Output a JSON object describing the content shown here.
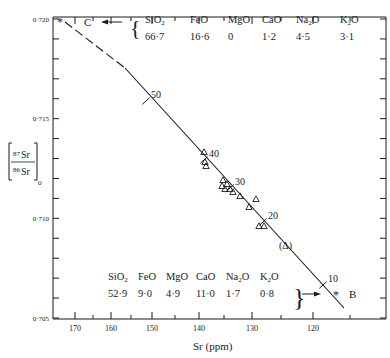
{
  "chart_data": {
    "type": "scatter",
    "title": "",
    "xlabel": "Sr (ppm)",
    "ylabel": "[87Sr/86Sr]0",
    "ylabel_parts": {
      "num_sup": "87",
      "num": "Sr",
      "den_sup": "86",
      "den": "Sr",
      "sub": "0"
    },
    "xlim": [
      175,
      110
    ],
    "ylim": [
      0.705,
      0.72
    ],
    "x_ticks": [
      {
        "value": 170,
        "label": "170",
        "px": 75
      },
      {
        "value": 165,
        "label": "",
        "px": 93
      },
      {
        "value": 160,
        "label": "160",
        "px": 111
      },
      {
        "value": 155,
        "label": "",
        "px": 131
      },
      {
        "value": 150,
        "label": "150",
        "px": 152
      },
      {
        "value": 145,
        "label": "",
        "px": 175
      },
      {
        "value": 140,
        "label": "140",
        "px": 199
      },
      {
        "value": 135,
        "label": "",
        "px": 224
      },
      {
        "value": 130,
        "label": "130",
        "px": 252
      },
      {
        "value": 125,
        "label": "",
        "px": 281
      },
      {
        "value": 120,
        "label": "120",
        "px": 313
      },
      {
        "value": 115,
        "label": "",
        "px": 350
      }
    ],
    "y_ticks": [
      {
        "value": 0.72,
        "label": "0·720"
      },
      {
        "value": 0.719,
        "label": ""
      },
      {
        "value": 0.718,
        "label": ""
      },
      {
        "value": 0.717,
        "label": ""
      },
      {
        "value": 0.716,
        "label": ""
      },
      {
        "value": 0.715,
        "label": "0·715"
      },
      {
        "value": 0.714,
        "label": ""
      },
      {
        "value": 0.713,
        "label": ""
      },
      {
        "value": 0.712,
        "label": ""
      },
      {
        "value": 0.711,
        "label": ""
      },
      {
        "value": 0.71,
        "label": "0·710"
      },
      {
        "value": 0.709,
        "label": ""
      },
      {
        "value": 0.708,
        "label": ""
      },
      {
        "value": 0.707,
        "label": ""
      },
      {
        "value": 0.706,
        "label": ""
      },
      {
        "value": 0.705,
        "label": "0·705"
      }
    ],
    "grid": false,
    "mixing_line": {
      "description": "Mixing line between end-members C and B; dashed toward C",
      "dashed_segment_px": [
        [
          65,
          22
        ],
        [
          125,
          68
        ]
      ],
      "solid_segment_px": [
        [
          125,
          68
        ],
        [
          344,
          308
        ]
      ],
      "percent_marks": [
        {
          "label": "50",
          "px": [
            146,
            101
          ]
        },
        {
          "label": "40",
          "px": [
            204,
            160
          ]
        },
        {
          "label": "30",
          "px": [
            230,
            188
          ]
        },
        {
          "label": "20",
          "px": [
            263,
            222
          ]
        },
        {
          "label": "10",
          "px": [
            323,
            285
          ]
        }
      ]
    },
    "series": [
      {
        "name": "samples",
        "marker": "triangle",
        "points_px": [
          [
            204,
            152
          ],
          [
            205,
            162
          ],
          [
            206,
            166
          ],
          [
            223,
            180
          ],
          [
            222,
            186
          ],
          [
            227,
            184
          ],
          [
            225,
            189
          ],
          [
            230,
            189
          ],
          [
            233,
            192
          ],
          [
            240,
            196
          ],
          [
            256,
            199
          ],
          [
            249,
            207
          ],
          [
            259,
            226
          ],
          [
            264,
            226
          ]
        ],
        "approx_values": [
          {
            "sr": 139.5,
            "ratio": 0.7137
          },
          {
            "sr": 139.3,
            "ratio": 0.7132
          },
          {
            "sr": 139.2,
            "ratio": 0.713
          },
          {
            "sr": 135.2,
            "ratio": 0.7123
          },
          {
            "sr": 135.4,
            "ratio": 0.712
          },
          {
            "sr": 134.4,
            "ratio": 0.7121
          },
          {
            "sr": 134.8,
            "ratio": 0.7119
          },
          {
            "sr": 133.8,
            "ratio": 0.7119
          },
          {
            "sr": 133.2,
            "ratio": 0.7117
          },
          {
            "sr": 131.9,
            "ratio": 0.7115
          },
          {
            "sr": 129.3,
            "ratio": 0.7114
          },
          {
            "sr": 130.4,
            "ratio": 0.711
          },
          {
            "sr": 128.8,
            "ratio": 0.7101
          },
          {
            "sr": 127.9,
            "ratio": 0.7101
          }
        ]
      }
    ],
    "annotations": [
      {
        "text": "(Δ)",
        "px": [
          287,
          245
        ]
      },
      {
        "text": "*",
        "label": "C",
        "note": "end-member C at Sr≈170, ratio 0.720, arrow pointing left"
      },
      {
        "text": "*",
        "label": "B",
        "note": "end-member B at Sr≈117, ratio≈0.7068, arrow pointing right"
      }
    ],
    "endmember_C": {
      "label": "C",
      "oxides": [
        "SiO2",
        "FeO",
        "MgO",
        "CaO",
        "Na2O",
        "K2O"
      ],
      "values": [
        "66·7",
        "16·6",
        "0",
        "1·2",
        "4·5",
        "3·1"
      ]
    },
    "endmember_B": {
      "label": "B",
      "oxides": [
        "SiO2",
        "FeO",
        "MgO",
        "CaO",
        "Na2O",
        "K2O"
      ],
      "values": [
        "52·9",
        "9·0",
        "4·9",
        "11·0",
        "1·7",
        "0·8"
      ]
    }
  },
  "labels": {
    "xlabel": "Sr (ppm)",
    "c_label": "C",
    "b_label": "B",
    "star": "*",
    "paren_triangle": "(Δ)",
    "y_num_sup": "87",
    "y_num": "Sr",
    "y_den_sup": "86",
    "y_den": "Sr",
    "y_sub": "0"
  }
}
